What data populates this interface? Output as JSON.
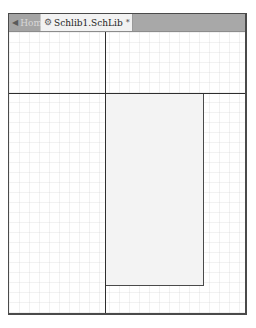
{
  "tabs": [
    {
      "label": "Home",
      "icon": "back-arrow-icon",
      "active": false
    },
    {
      "label": "Schlib1.SchLib",
      "icon": "schematic-library-icon",
      "active": true,
      "modified_marker": "*"
    }
  ],
  "canvas": {
    "grid": true,
    "colors": {
      "background": "#ffffff",
      "grid_line": "#e8e8e8",
      "axis_line": "#2e2e2e",
      "component_fill": "#f3f3f3",
      "component_border": "#4a4a4a"
    }
  },
  "icons": {
    "home": "◆",
    "library": "⚙"
  }
}
